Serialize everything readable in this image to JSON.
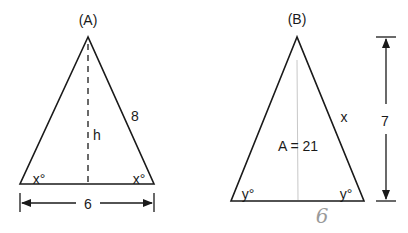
{
  "figure_a": {
    "label": "(A)",
    "side_label": "8",
    "height_label": "h",
    "base_angle_left": "x°",
    "base_angle_right": "x°",
    "base_label": "6"
  },
  "figure_b": {
    "label": "(B)",
    "side_label": "x",
    "area_label": "A = 21",
    "height_label": "7",
    "base_angle_left": "y°",
    "base_angle_right": "y°",
    "handwritten_base": "6"
  },
  "colors": {
    "line": "#1a1a1a",
    "pencil": "#9a9a9a"
  }
}
